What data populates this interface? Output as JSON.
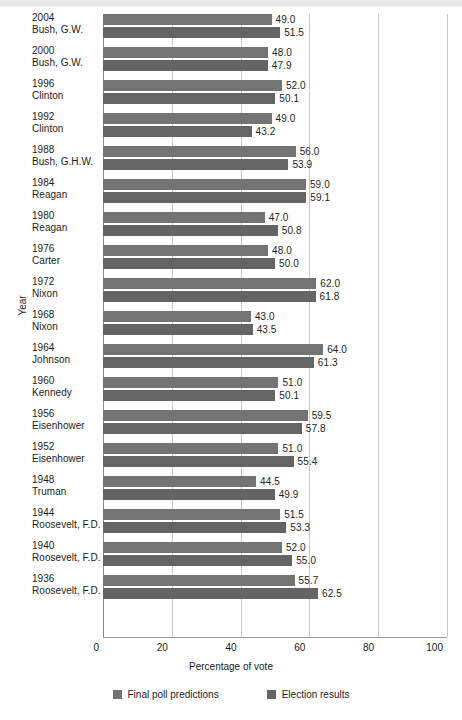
{
  "chart_data": {
    "type": "bar",
    "orientation": "horizontal",
    "title": "",
    "xlabel": "Percentage of vote",
    "ylabel": "Year",
    "xlim": [
      0,
      100
    ],
    "xticks": [
      0,
      20,
      40,
      60,
      80,
      100
    ],
    "grid": true,
    "legend_position": "bottom",
    "categories": [
      {
        "year": "2004",
        "president": "Bush, G.W."
      },
      {
        "year": "2000",
        "president": "Bush, G.W."
      },
      {
        "year": "1996",
        "president": "Clinton"
      },
      {
        "year": "1992",
        "president": "Clinton"
      },
      {
        "year": "1988",
        "president": "Bush, G.H.W."
      },
      {
        "year": "1984",
        "president": "Reagan"
      },
      {
        "year": "1980",
        "president": "Reagan"
      },
      {
        "year": "1976",
        "president": "Carter"
      },
      {
        "year": "1972",
        "president": "Nixon"
      },
      {
        "year": "1968",
        "president": "Nixon"
      },
      {
        "year": "1964",
        "president": "Johnson"
      },
      {
        "year": "1960",
        "president": "Kennedy"
      },
      {
        "year": "1956",
        "president": "Eisenhower"
      },
      {
        "year": "1952",
        "president": "Eisenhower"
      },
      {
        "year": "1948",
        "president": "Truman"
      },
      {
        "year": "1944",
        "president": "Roosevelt, F.D."
      },
      {
        "year": "1940",
        "president": "Roosevelt, F.D."
      },
      {
        "year": "1936",
        "president": "Roosevelt, F.D."
      }
    ],
    "series": [
      {
        "name": "Final poll predictions",
        "color": "#737373",
        "values": [
          49.0,
          48.0,
          52.0,
          49.0,
          56.0,
          59.0,
          47.0,
          48.0,
          62.0,
          43.0,
          64.0,
          51.0,
          59.5,
          51.0,
          44.5,
          51.5,
          52.0,
          55.7
        ],
        "labels": [
          "49.0",
          "48.0",
          "52.0",
          "49.0",
          "56.0",
          "59.0",
          "47.0",
          "48.0",
          "62.0",
          "43.0",
          "64.0",
          "51.0",
          "59.5",
          "51.0",
          "44.5",
          "51.5",
          "52.0",
          "55.7"
        ]
      },
      {
        "name": "Election results",
        "color": "#646464",
        "values": [
          51.5,
          47.9,
          50.1,
          43.2,
          53.9,
          59.1,
          50.8,
          50.0,
          61.8,
          43.5,
          61.3,
          50.1,
          57.8,
          55.4,
          49.9,
          53.3,
          55.0,
          62.5
        ],
        "labels": [
          "51.5",
          "47.9",
          "50.1",
          "43.2",
          "53.9",
          "59.1",
          "50.8",
          "50.0",
          "61.8",
          "43.5",
          "61.3",
          "50.1",
          "57.8",
          "55.4",
          "49.9",
          "53.3",
          "55.0",
          "62.5"
        ]
      }
    ]
  },
  "axis": {
    "xlabel": "Percentage of vote",
    "ylabel": "Year",
    "ticks": [
      "0",
      "20",
      "40",
      "60",
      "80",
      "100"
    ]
  },
  "legend": {
    "items": [
      {
        "label": "Final poll predictions",
        "color": "#737373"
      },
      {
        "label": "Election results",
        "color": "#646464"
      }
    ]
  }
}
